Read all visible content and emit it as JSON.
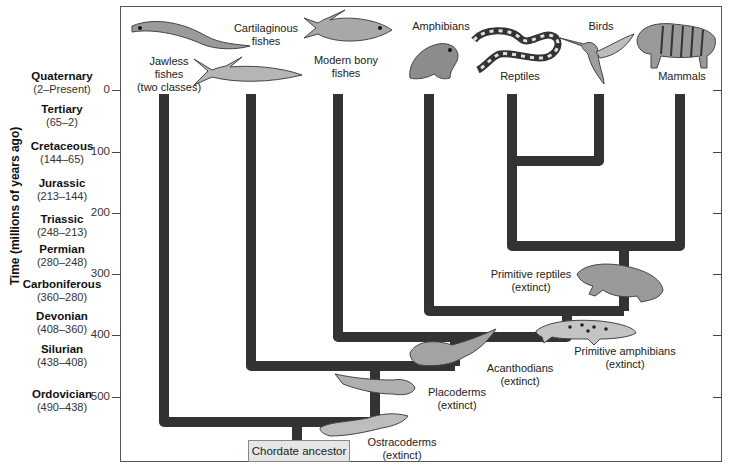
{
  "axis": {
    "title": "Time (millions of years ago)",
    "ticks": [
      {
        "label": "0",
        "value": 0
      },
      {
        "label": "100",
        "value": 100
      },
      {
        "label": "200",
        "value": 200
      },
      {
        "label": "300",
        "value": 300
      },
      {
        "label": "400",
        "value": 400
      },
      {
        "label": "500",
        "value": 500
      }
    ]
  },
  "periods": [
    {
      "name": "Quaternary",
      "range": "(2–Present)"
    },
    {
      "name": "Tertiary",
      "range": "(65–2)"
    },
    {
      "name": "Cretaceous",
      "range": "(144–65)"
    },
    {
      "name": "Jurassic",
      "range": "(213–144)"
    },
    {
      "name": "Triassic",
      "range": "(248–213)"
    },
    {
      "name": "Permian",
      "range": "(280–248)"
    },
    {
      "name": "Carboniferous",
      "range": "(360–280)"
    },
    {
      "name": "Devonian",
      "range": "(408–360)"
    },
    {
      "name": "Silurian",
      "range": "(438–408)"
    },
    {
      "name": "Ordovician",
      "range": "(490–438)"
    }
  ],
  "living_groups": {
    "jawless": {
      "line1": "Jawless",
      "line2": "fishes",
      "line3": "(two classes)"
    },
    "cartilaginous": {
      "line1": "Cartilaginous",
      "line2": "fishes"
    },
    "bony": {
      "line1": "Modern bony",
      "line2": "fishes"
    },
    "amphibians": {
      "line1": "Amphibians"
    },
    "reptiles": {
      "line1": "Reptiles"
    },
    "birds": {
      "line1": "Birds"
    },
    "mammals": {
      "line1": "Mammals"
    }
  },
  "extinct_groups": {
    "primitive_reptiles": {
      "line1": "Primitive reptiles",
      "line2": "(extinct)"
    },
    "primitive_amphibians": {
      "line1": "Primitive amphibians",
      "line2": "(extinct)"
    },
    "acanthodians": {
      "line1": "Acanthodians",
      "line2": "(extinct)"
    },
    "placoderms": {
      "line1": "Placoderms",
      "line2": "(extinct)"
    },
    "ostracoderms": {
      "line1": "Ostracoderms",
      "line2": "(extinct)"
    }
  },
  "root": {
    "label": "Chordate ancestor"
  },
  "colors": {
    "branch": "#333333",
    "frame": "#555555",
    "ancestor_box": "#e6e6e6"
  }
}
